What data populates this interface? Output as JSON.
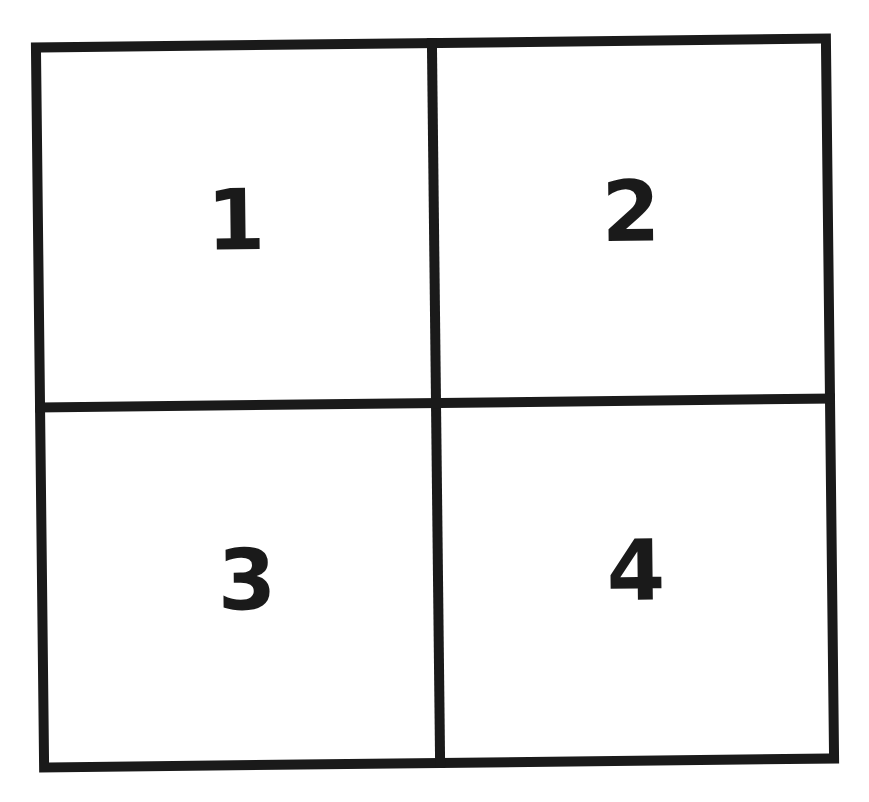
{
  "diagram": {
    "type": "2x2-grid",
    "line_color": "#1a1a1a",
    "background": "#ffffff",
    "quadrants": [
      {
        "position": "top-left",
        "label": "1"
      },
      {
        "position": "top-right",
        "label": "2"
      },
      {
        "position": "bottom-left",
        "label": "3"
      },
      {
        "position": "bottom-right",
        "label": "4"
      }
    ]
  }
}
